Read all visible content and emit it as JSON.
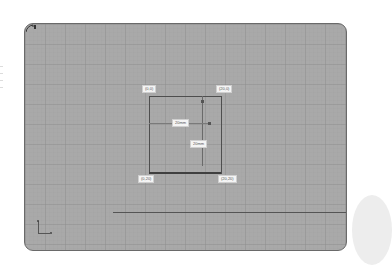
{
  "canvas": {
    "background": "#a9a9a9",
    "grid": true
  },
  "sketch": {
    "corner_labels": {
      "top_left": "(0,0)",
      "top_right": "(20,0)",
      "bottom_left": "(0,20)",
      "bottom_right": "(20,20)"
    },
    "dimensions": {
      "width": "20mm",
      "height": "20mm"
    }
  },
  "icons": {
    "corner_tool": "sketch-tool-icon",
    "axis": "origin-axis-icon"
  }
}
